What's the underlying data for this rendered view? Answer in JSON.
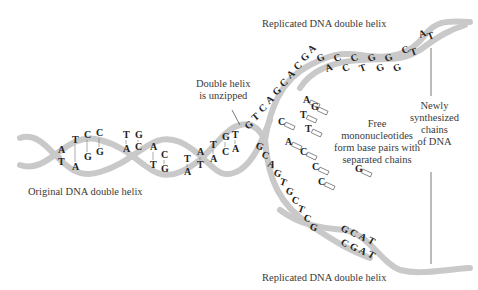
{
  "labels": {
    "original": "Original DNA double helix",
    "unzipped_line1": "Double helix",
    "unzipped_line2": "is unzipped",
    "replicated_top": "Replicated DNA double helix",
    "replicated_bottom": "Replicated DNA double helix",
    "free_line1": "Free",
    "free_line2": "mononucleotides",
    "free_line3": "form base pairs with",
    "free_line4": "separated chains",
    "newly_line1": "Newly",
    "newly_line2": "synthesized",
    "newly_line3": "chains",
    "newly_line4": "of DNA"
  },
  "original_pairs": [
    {
      "top": "A",
      "bottom": "T"
    },
    {
      "top": "T",
      "bottom": "A"
    },
    {
      "top": "C",
      "bottom": "G"
    },
    {
      "top": "C",
      "bottom": "G"
    },
    {
      "top": "T",
      "bottom": "A"
    },
    {
      "top": "G",
      "bottom": "C"
    },
    {
      "top": "A",
      "bottom": "T"
    },
    {
      "top": "C",
      "bottom": "G"
    },
    {
      "top": "T",
      "bottom": "A"
    },
    {
      "top": "A",
      "bottom": "T"
    },
    {
      "top": "T",
      "bottom": "A"
    },
    {
      "top": "G",
      "bottom": "C"
    },
    {
      "top": "T",
      "bottom": "A"
    }
  ],
  "upper_strand_bases": [
    "G",
    "T",
    "C",
    "A",
    "G",
    "C",
    "A",
    "C",
    "G",
    "A"
  ],
  "top_helix_bases": [
    "G",
    "A",
    "C",
    "C",
    "C",
    "T",
    "G",
    "G",
    "G",
    "G",
    "C",
    "T",
    "A",
    "T"
  ],
  "lower_strand_bases": [
    "G",
    "C",
    "A",
    "G",
    "T",
    "G",
    "C",
    "T",
    "C",
    "G"
  ],
  "bottom_helix_bases": [
    "G",
    "C",
    "A",
    "T",
    "C",
    "G",
    "A",
    "T"
  ],
  "free_nucleotides": [
    "A",
    "G",
    "T",
    "C",
    "T",
    "A",
    "C",
    "C",
    "C",
    "G"
  ],
  "colors": {
    "ribbon": "#c9c9c9",
    "ribbon_edge": "#9a9a9a",
    "text": "#3a3a3a",
    "background": "#ffffff"
  }
}
